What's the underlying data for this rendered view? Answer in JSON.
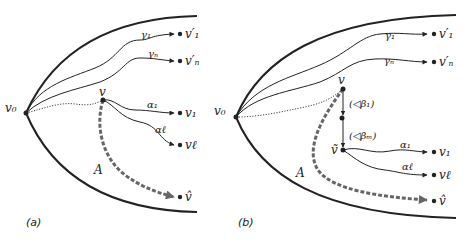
{
  "figure": {
    "panels": [
      {
        "id": "a",
        "label": "(a)",
        "root": "v₀",
        "upper_paths": [
          {
            "edge": "γ₁",
            "target": "v′₁"
          },
          {
            "edge": "γₙ",
            "target": "v′ₙ"
          }
        ],
        "branch_node": "v",
        "lower_paths": [
          {
            "edge": "α₁",
            "target": "v₁"
          },
          {
            "edge": "αℓ",
            "target": "vℓ"
          }
        ],
        "dashed_path": {
          "label": "A",
          "target": "v̂"
        }
      },
      {
        "id": "b",
        "label": "(b)",
        "root": "v₀",
        "upper_paths": [
          {
            "edge": "γ₁",
            "target": "v′₁"
          },
          {
            "edge": "γₙ",
            "target": "v′ₙ"
          }
        ],
        "branch_node": "v",
        "chain": [
          {
            "edge": "(◁β₁)"
          },
          {
            "edge": "(◁βₘ)"
          }
        ],
        "chain_end": "ṽ",
        "lower_paths": [
          {
            "edge": "α₁",
            "target": "v₁"
          },
          {
            "edge": "αℓ",
            "target": "vℓ"
          }
        ],
        "dashed_path": {
          "label": "A",
          "target": "v̂"
        }
      }
    ],
    "colors": {
      "line": "#222222",
      "dashed": "#666666"
    }
  }
}
